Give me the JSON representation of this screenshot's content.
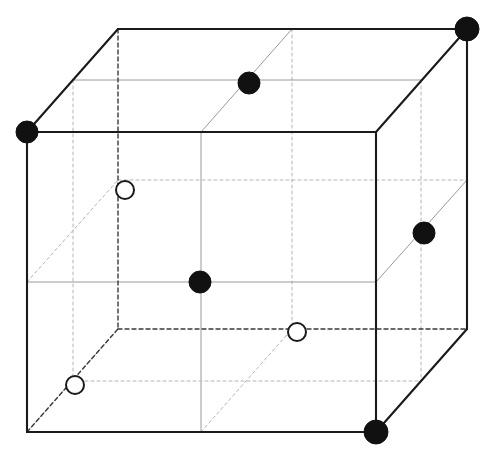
{
  "figure": {
    "kind": "crystal-unit-cell-cube",
    "width": 496,
    "height": 457,
    "background_color": "#ffffff",
    "caption_fragment": "partial text line clipped at bottom edge"
  },
  "style": {
    "solid_edge_color": "#1a1a1a",
    "solid_edge_width": 2.1,
    "hidden_edge_color": "#3a3a3a",
    "hidden_edge_width": 1.4,
    "hidden_edge_dash": "4 3",
    "interior_solid_color": "#9a9a9a",
    "interior_solid_width": 1.0,
    "interior_dashed_color": "#b4b4b4",
    "interior_dashed_width": 1.0,
    "interior_dash": "3 3",
    "filled_atom_fill": "#111111",
    "filled_atom_stroke": "#111111",
    "open_atom_fill": "#ffffff",
    "open_atom_stroke": "#1a1a1a",
    "open_atom_stroke_width": 2.0
  },
  "geometry": {
    "front_left_x": 27,
    "front_right_x": 376,
    "front_top_y": 132,
    "front_bottom_y": 432,
    "depth_dx": 91,
    "depth_dy": -103
  },
  "vertices": [
    {
      "name": "front-bottom-left",
      "x": 27,
      "y": 432
    },
    {
      "name": "front-bottom-right",
      "x": 376,
      "y": 432
    },
    {
      "name": "front-top-right",
      "x": 376,
      "y": 132
    },
    {
      "name": "front-top-left",
      "x": 27,
      "y": 132
    },
    {
      "name": "back-bottom-left",
      "x": 118,
      "y": 329
    },
    {
      "name": "back-bottom-right",
      "x": 467,
      "y": 329
    },
    {
      "name": "back-top-right",
      "x": 467,
      "y": 29
    },
    {
      "name": "back-top-left",
      "x": 118,
      "y": 29
    }
  ],
  "edges_solid": [
    {
      "name": "front-bottom",
      "x1": 27,
      "y1": 432,
      "x2": 376,
      "y2": 432
    },
    {
      "name": "front-right",
      "x1": 376,
      "y1": 432,
      "x2": 376,
      "y2": 132
    },
    {
      "name": "front-top",
      "x1": 376,
      "y1": 132,
      "x2": 27,
      "y2": 132
    },
    {
      "name": "front-left",
      "x1": 27,
      "y1": 132,
      "x2": 27,
      "y2": 432
    },
    {
      "name": "back-top",
      "x1": 118,
      "y1": 29,
      "x2": 467,
      "y2": 29
    },
    {
      "name": "back-right",
      "x1": 467,
      "y1": 29,
      "x2": 467,
      "y2": 329
    },
    {
      "name": "edge-top-left-depth",
      "x1": 27,
      "y1": 132,
      "x2": 118,
      "y2": 29
    },
    {
      "name": "edge-top-right-depth",
      "x1": 376,
      "y1": 132,
      "x2": 467,
      "y2": 29
    },
    {
      "name": "edge-bottom-right-depth",
      "x1": 376,
      "y1": 432,
      "x2": 467,
      "y2": 329
    }
  ],
  "edges_hidden": [
    {
      "name": "back-bottom",
      "x1": 118,
      "y1": 329,
      "x2": 467,
      "y2": 329
    },
    {
      "name": "back-left",
      "x1": 118,
      "y1": 29,
      "x2": 118,
      "y2": 329
    },
    {
      "name": "edge-bottom-left-depth",
      "x1": 27,
      "y1": 432,
      "x2": 118,
      "y2": 329
    }
  ],
  "interior_lines": [
    {
      "name": "mid-vertical-front",
      "x1": 201,
      "y1": 132,
      "x2": 201,
      "y2": 432,
      "style": "solid"
    },
    {
      "name": "mid-vertical-back",
      "x1": 292,
      "y1": 29,
      "x2": 292,
      "y2": 329,
      "style": "dashed"
    },
    {
      "name": "mid-horizontal-left",
      "x1": 27,
      "y1": 282,
      "x2": 376,
      "y2": 282,
      "style": "solid"
    },
    {
      "name": "mid-horizontal-back",
      "x1": 118,
      "y1": 180,
      "x2": 467,
      "y2": 180,
      "style": "dashed"
    },
    {
      "name": "mid-depth-top",
      "x1": 73,
      "y1": 80,
      "x2": 421,
      "y2": 80,
      "style": "solid"
    },
    {
      "name": "mid-depth-bottom",
      "x1": 73,
      "y1": 381,
      "x2": 421,
      "y2": 381,
      "style": "dashed"
    },
    {
      "name": "mid-diag-top",
      "x1": 201,
      "y1": 132,
      "x2": 292,
      "y2": 29,
      "style": "solid"
    },
    {
      "name": "mid-diag-bottom",
      "x1": 201,
      "y1": 432,
      "x2": 292,
      "y2": 329,
      "style": "dashed"
    },
    {
      "name": "mid-diag-left-upper",
      "x1": 27,
      "y1": 282,
      "x2": 118,
      "y2": 180,
      "style": "dashed"
    },
    {
      "name": "mid-diag-right-upper",
      "x1": 376,
      "y1": 282,
      "x2": 467,
      "y2": 180,
      "style": "solid"
    },
    {
      "name": "mid-depth-vertical-left",
      "x1": 73,
      "y1": 80,
      "x2": 73,
      "y2": 381,
      "style": "dashed"
    },
    {
      "name": "mid-depth-vertical-right",
      "x1": 421,
      "y1": 80,
      "x2": 421,
      "y2": 381,
      "style": "dashed"
    },
    {
      "name": "mid-plane-diag-lower-left",
      "x1": 27,
      "y1": 432,
      "x2": 118,
      "y2": 329,
      "style": "dashed"
    }
  ],
  "atoms": [
    {
      "name": "atom-corner-front-top-left",
      "type": "filled",
      "x": 27,
      "y": 132,
      "r": 11
    },
    {
      "name": "atom-corner-back-top-right",
      "type": "filled",
      "x": 467,
      "y": 29,
      "r": 12
    },
    {
      "name": "atom-corner-front-bottom-right",
      "type": "filled",
      "x": 376,
      "y": 432,
      "r": 12
    },
    {
      "name": "atom-face-top",
      "type": "filled",
      "x": 249,
      "y": 83,
      "r": 11
    },
    {
      "name": "atom-body-center",
      "type": "filled",
      "x": 200,
      "y": 282,
      "r": 11
    },
    {
      "name": "atom-face-right",
      "type": "filled",
      "x": 424,
      "y": 233,
      "r": 11
    },
    {
      "name": "atom-open-upper-left",
      "type": "open",
      "x": 125,
      "y": 190,
      "r": 9
    },
    {
      "name": "atom-open-lower-left",
      "type": "open",
      "x": 75,
      "y": 385,
      "r": 9
    },
    {
      "name": "atom-open-lower-right",
      "type": "open",
      "x": 297,
      "y": 332,
      "r": 9
    }
  ],
  "legend": {
    "filled_label": "filled atom",
    "open_label": "open atom"
  }
}
